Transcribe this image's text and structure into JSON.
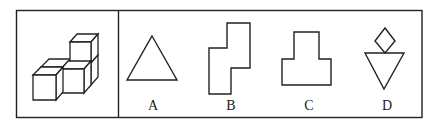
{
  "puzzle": {
    "description": "Three-view / spatial reasoning question: a 3D arrangement of unit cubes and four 2D outline options",
    "question_figure": {
      "type": "isometric-cube-stack",
      "cube_count_visible": 4
    },
    "options": [
      {
        "label": "A",
        "shape": "equilateral-triangle"
      },
      {
        "label": "B",
        "shape": "stepped-polygon"
      },
      {
        "label": "C",
        "shape": "inverted-t-polygon"
      },
      {
        "label": "D",
        "shape": "diamond-over-inverted-triangle"
      }
    ]
  },
  "colors": {
    "stroke": "#222222",
    "background": "#ffffff"
  }
}
